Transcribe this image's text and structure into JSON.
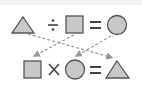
{
  "diagram": {
    "row1": {
      "items": [
        "triangle",
        "divide",
        "square",
        "equals",
        "circle"
      ],
      "operator": "÷",
      "equals": "="
    },
    "row2": {
      "items": [
        "square",
        "multiply",
        "circle",
        "equals",
        "triangle"
      ],
      "operator": "×",
      "equals": "="
    },
    "arrows": [
      {
        "from": "row1.triangle",
        "to": "row2.triangle"
      },
      {
        "from": "row1.square",
        "to": "row2.square"
      },
      {
        "from": "row1.circle",
        "to": "row2.circle"
      }
    ],
    "colors": {
      "shape_fill": "#c8c8c8",
      "shape_stroke": "#555555",
      "arrow": "#999999",
      "symbol": "#444444"
    }
  }
}
